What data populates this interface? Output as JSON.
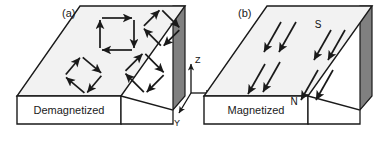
{
  "figure": {
    "width": 388,
    "height": 142,
    "background": "#ffffff",
    "line_color": "#1a1a1a",
    "top_face_color": "#f2f2f2",
    "side_face_color": "#808080",
    "front_face_color": "#ffffff"
  },
  "panels": [
    {
      "id": "a",
      "label": "(a)",
      "caption": "Demagnetized",
      "description": "closed-flux domain loops",
      "domains": [
        {
          "name": "domain-loop-top-left",
          "cx": 118,
          "cy": 33,
          "r": 18,
          "rotation": 0
        },
        {
          "name": "domain-loop-top-right",
          "cx": 163,
          "cy": 28,
          "r": 17,
          "rotation": 45
        },
        {
          "name": "domain-loop-bottom-left",
          "cx": 85,
          "cy": 75,
          "r": 17,
          "rotation": 40
        },
        {
          "name": "domain-loop-bottom-right",
          "cx": 146,
          "cy": 73,
          "r": 18,
          "rotation": 45
        }
      ]
    },
    {
      "id": "b",
      "label": "(b)",
      "caption": "Magnetized",
      "description": "aligned magnetization arrows",
      "poles": [
        {
          "name": "south-pole-label",
          "text": "S",
          "x": 318,
          "y": 28
        },
        {
          "name": "north-pole-label",
          "text": "N",
          "x": 296,
          "y": 104
        }
      ],
      "arrows": [
        {
          "x1": 281,
          "y1": 22,
          "x2": 264,
          "y2": 54
        },
        {
          "x1": 296,
          "y1": 22,
          "x2": 279,
          "y2": 54
        },
        {
          "x1": 331,
          "y1": 30,
          "x2": 314,
          "y2": 62
        },
        {
          "x1": 345,
          "y1": 30,
          "x2": 328,
          "y2": 62
        },
        {
          "x1": 265,
          "y1": 64,
          "x2": 248,
          "y2": 96
        },
        {
          "x1": 280,
          "y1": 62,
          "x2": 263,
          "y2": 94
        },
        {
          "x1": 318,
          "y1": 70,
          "x2": 301,
          "y2": 102
        },
        {
          "x1": 333,
          "y1": 70,
          "x2": 316,
          "y2": 102
        }
      ]
    }
  ],
  "axes": {
    "name": "coordinate-axes",
    "origin": {
      "x": 191,
      "y": 93
    },
    "items": [
      {
        "label": "Z",
        "direction": "up",
        "tip_x": 191,
        "tip_y": 62,
        "label_x": 196,
        "label_y": 62
      },
      {
        "label": "X",
        "direction": "right",
        "tip_x": 214,
        "tip_y": 93,
        "label_x": 218,
        "label_y": 96
      },
      {
        "label": "Y",
        "direction": "down-left",
        "tip_x": 178,
        "tip_y": 115,
        "label_x": 177,
        "label_y": 126
      }
    ]
  }
}
